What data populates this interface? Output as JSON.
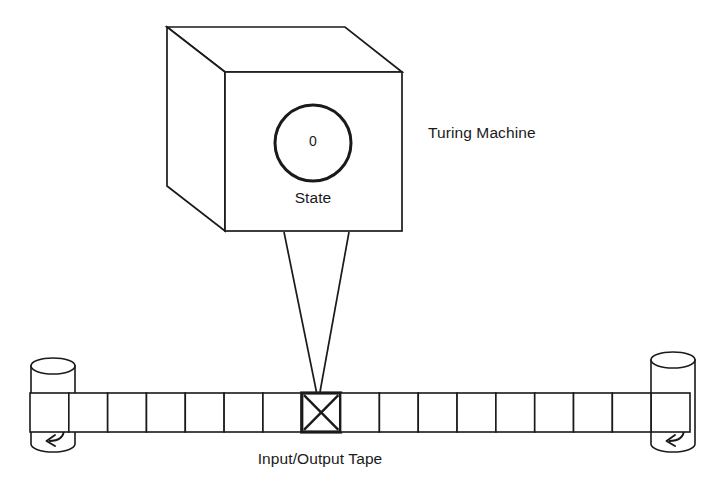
{
  "diagram": {
    "title": "Turing Machine",
    "background_color": "#ffffff",
    "stroke_color": "#1a1a1a",
    "labels": {
      "machine": "Turing Machine",
      "tape": "Input/Output Tape",
      "state": "State",
      "state_value": "0"
    },
    "machine_box": {
      "name": "control-unit-cube",
      "front_face": {
        "x": 225,
        "y": 72,
        "width": 177,
        "height": 159
      },
      "depth_offset": {
        "dx": -58,
        "dy": -45
      }
    },
    "state_indicator": {
      "name": "state-circle",
      "center_x": 313,
      "center_y": 143,
      "radius": 38,
      "value": "0"
    },
    "read_write_head": {
      "name": "read-write-head-funnel",
      "top_left_x": 284,
      "top_right_x": 349,
      "top_y": 232,
      "tip_x": 318,
      "tip_y": 392
    },
    "tape": {
      "name": "io-tape",
      "left_x": 30,
      "right_x": 690,
      "top_y": 393,
      "bottom_y": 432,
      "cell_count": 17,
      "cell_width": 38.8,
      "highlighted_cell_index": 7,
      "highlighted_cell_mark": "x-cross",
      "cells": [
        {
          "index": 0,
          "content": ""
        },
        {
          "index": 1,
          "content": ""
        },
        {
          "index": 2,
          "content": ""
        },
        {
          "index": 3,
          "content": ""
        },
        {
          "index": 4,
          "content": ""
        },
        {
          "index": 5,
          "content": ""
        },
        {
          "index": 6,
          "content": ""
        },
        {
          "index": 7,
          "content": "X"
        },
        {
          "index": 8,
          "content": ""
        },
        {
          "index": 9,
          "content": ""
        },
        {
          "index": 10,
          "content": ""
        },
        {
          "index": 11,
          "content": ""
        },
        {
          "index": 12,
          "content": ""
        },
        {
          "index": 13,
          "content": ""
        },
        {
          "index": 14,
          "content": ""
        },
        {
          "index": 15,
          "content": ""
        },
        {
          "index": 16,
          "content": ""
        }
      ]
    },
    "spools": [
      {
        "name": "left-spool",
        "side": "left",
        "center_x": 53,
        "top_y": 366,
        "bottom_y": 452,
        "radius_x": 22,
        "radius_y": 8,
        "arrow": "curved-left-arrow"
      },
      {
        "name": "right-spool",
        "side": "right",
        "center_x": 673,
        "top_y": 360,
        "bottom_y": 452,
        "radius_x": 22,
        "radius_y": 8,
        "arrow": "curved-left-arrow"
      }
    ]
  }
}
